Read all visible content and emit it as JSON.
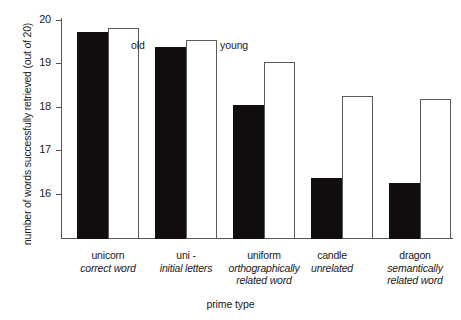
{
  "chart_data": {
    "type": "bar",
    "title": "",
    "xlabel": "prime type",
    "ylabel": "number of words successfully retrieved (out of 20)",
    "ylim": [
      15.55,
      20.1
    ],
    "yticks": [
      16,
      17,
      18,
      19,
      20
    ],
    "ytick_labels": [
      "16",
      "17",
      "18",
      "19",
      "20"
    ],
    "grid": false,
    "legend_position": "in-plot annotations above second group",
    "categories": [
      "unicorn\ncorrect word",
      "uni -\ninitial letters",
      "uniform\northographically related word",
      "candle\nunrelated",
      "dragon\nsemantically related word"
    ],
    "category_words": [
      "unicorn",
      "uni -",
      "uniform",
      "candle",
      "dragon"
    ],
    "category_descriptions": [
      "correct word",
      "initial letters",
      "orthographically related word",
      "unrelated",
      "semantically related word"
    ],
    "series": [
      {
        "name": "old",
        "fill": "#120e0d",
        "values": [
          19.82,
          19.5,
          18.3,
          16.8,
          16.7
        ]
      },
      {
        "name": "young",
        "fill": "#ffffff",
        "values": [
          19.9,
          19.65,
          19.2,
          18.5,
          18.43
        ]
      }
    ],
    "annotations": [
      {
        "text": "old",
        "series": "old"
      },
      {
        "text": "young",
        "series": "young"
      }
    ]
  },
  "axes": {
    "y_title": "number of words successfully retrieved (out of 20)",
    "x_title": "prime type",
    "ticks": {
      "t20": "20",
      "t19": "19",
      "t18": "18",
      "t17": "17",
      "t16": "16"
    }
  },
  "annotations": {
    "old": "old",
    "young": "young"
  },
  "categories": [
    {
      "word": "unicorn",
      "desc": "correct word"
    },
    {
      "word": "uni -",
      "desc": "initial letters"
    },
    {
      "word": "uniform",
      "desc": "orthographically related word"
    },
    {
      "word": "candle",
      "desc": "unrelated"
    },
    {
      "word": "dragon",
      "desc": "semantically related word"
    }
  ],
  "colors": {
    "old_bar": "#120e0d",
    "young_bar": "#ffffff",
    "axis": "#545454",
    "text": "#1a1a1a",
    "background": "#ffffff"
  }
}
